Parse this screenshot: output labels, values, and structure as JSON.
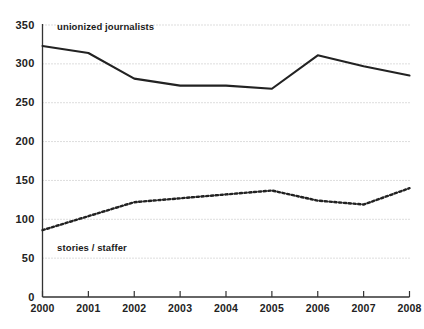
{
  "chart_data": {
    "type": "line",
    "title": "",
    "subtitle": "",
    "xlabel": "",
    "ylabel": "",
    "x": [
      2000,
      2001,
      2002,
      2003,
      2004,
      2005,
      2006,
      2007,
      2008
    ],
    "xtick_labels": [
      "2000",
      "2001",
      "2002",
      "2003",
      "2004",
      "2005",
      "2006",
      "2007",
      "2008"
    ],
    "ytick_labels": [
      "0",
      "50",
      "100",
      "150",
      "200",
      "250",
      "300",
      "350"
    ],
    "ytick_values": [
      0,
      50,
      100,
      150,
      200,
      250,
      300,
      350
    ],
    "ylim": [
      0,
      350
    ],
    "xlim": [
      2000,
      2008
    ],
    "grid": true,
    "grid_style": "dotted-horizontal",
    "legend": "inline-annotations",
    "series": [
      {
        "name": "unionized journalists",
        "style": "solid",
        "color": "#222222",
        "label_x": 2000.1,
        "label_y": 347,
        "values": [
          323,
          314,
          281,
          272,
          272,
          268,
          311,
          297,
          285
        ]
      },
      {
        "name": "stories / staffer",
        "style": "dotted",
        "color": "#222222",
        "label_x": 2000.1,
        "label_y": 63,
        "values": [
          86,
          104,
          122,
          127,
          132,
          137,
          124,
          119,
          140
        ]
      }
    ]
  },
  "axes": {
    "axis_color": "#333333",
    "grid_color": "#bbbbbb",
    "background": "#ffffff"
  }
}
